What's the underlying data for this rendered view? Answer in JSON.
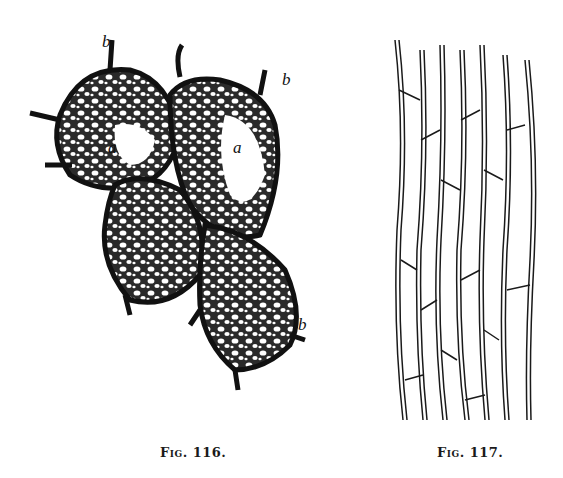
{
  "figures": [
    {
      "id": "fig116",
      "caption": "Fig. 116.",
      "description": "Four clustered cells with reticulate (net-like) thickened walls; dark outer walls with protruding stubs",
      "labels": [
        "b",
        "b",
        "a",
        "a",
        "b"
      ]
    },
    {
      "id": "fig117",
      "caption": "Fig. 117.",
      "description": "Tissue of elongated parallel cells (longitudinal section)"
    }
  ]
}
